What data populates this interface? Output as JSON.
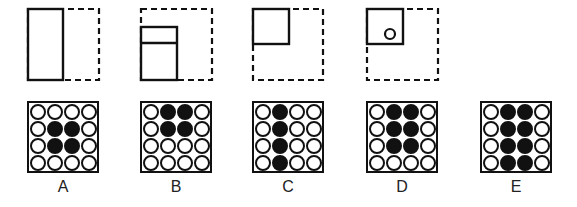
{
  "top_figures": [
    {
      "id": "A",
      "dashed_box": {
        "x": 28,
        "y": 9,
        "w": 71,
        "h": 71
      },
      "solid_shapes": [
        {
          "type": "rect",
          "x": 28,
          "y": 9,
          "w": 35,
          "h": 71
        }
      ],
      "circle": null
    },
    {
      "id": "B",
      "dashed_box": {
        "x": 141,
        "y": 9,
        "w": 71,
        "h": 71
      },
      "solid_shapes": [
        {
          "type": "rect",
          "x": 141,
          "y": 27,
          "w": 36,
          "h": 53
        },
        {
          "type": "line",
          "x1": 141,
          "y1": 43,
          "x2": 177,
          "y2": 43
        }
      ],
      "circle": null
    },
    {
      "id": "C",
      "dashed_box": {
        "x": 253,
        "y": 9,
        "w": 70,
        "h": 71
      },
      "solid_shapes": [
        {
          "type": "rect",
          "x": 253,
          "y": 9,
          "w": 36,
          "h": 35
        }
      ],
      "circle": null
    },
    {
      "id": "D",
      "dashed_box": {
        "x": 367,
        "y": 9,
        "w": 71,
        "h": 71
      },
      "solid_shapes": [
        {
          "type": "rect",
          "x": 367,
          "y": 9,
          "w": 36,
          "h": 35
        }
      ],
      "circle": {
        "cx": 390,
        "cy": 34,
        "r": 5
      }
    }
  ],
  "options": [
    {
      "label": "A",
      "x": 27,
      "grid": [
        [
          0,
          0,
          0,
          0
        ],
        [
          0,
          1,
          1,
          0
        ],
        [
          0,
          1,
          1,
          0
        ],
        [
          0,
          0,
          0,
          0
        ]
      ]
    },
    {
      "label": "B",
      "x": 140,
      "grid": [
        [
          0,
          1,
          1,
          0
        ],
        [
          0,
          1,
          1,
          0
        ],
        [
          0,
          0,
          0,
          0
        ],
        [
          0,
          0,
          0,
          0
        ]
      ]
    },
    {
      "label": "C",
      "x": 252,
      "grid": [
        [
          0,
          1,
          0,
          0
        ],
        [
          0,
          1,
          0,
          0
        ],
        [
          0,
          1,
          0,
          0
        ],
        [
          0,
          1,
          0,
          0
        ]
      ]
    },
    {
      "label": "D",
      "x": 366,
      "grid": [
        [
          0,
          1,
          1,
          0
        ],
        [
          0,
          1,
          1,
          0
        ],
        [
          0,
          1,
          1,
          0
        ],
        [
          0,
          0,
          0,
          0
        ]
      ]
    },
    {
      "label": "E",
      "x": 480,
      "grid": [
        [
          0,
          1,
          1,
          0
        ],
        [
          0,
          1,
          1,
          0
        ],
        [
          0,
          1,
          1,
          0
        ],
        [
          0,
          1,
          1,
          0
        ]
      ]
    }
  ],
  "colors": {
    "ink": "#111111",
    "background": "#ffffff"
  }
}
